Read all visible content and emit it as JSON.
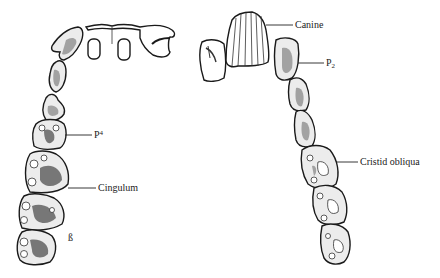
{
  "figure": {
    "type": "dental-arcade-illustration",
    "panels": [
      {
        "id": "upper-dentition",
        "position": "left",
        "labels": [
          {
            "text": "P",
            "superscript": "4",
            "full": "P4",
            "x": 94,
            "y": 124
          },
          {
            "text": "Cingulum",
            "full": "Cingulum",
            "x": 98,
            "y": 180
          },
          {
            "text": "ß",
            "full": "ß",
            "x": 68,
            "y": 232
          }
        ]
      },
      {
        "id": "lower-dentition",
        "position": "right",
        "labels": [
          {
            "text": "Canine",
            "full": "Canine",
            "x": 295,
            "y": 20
          },
          {
            "text": "P",
            "subscript": "2",
            "full": "P2",
            "x": 326,
            "y": 60
          },
          {
            "text": "Cristid obliqua",
            "full": "Cristid obliqua",
            "x": 360,
            "y": 157
          }
        ]
      }
    ]
  }
}
